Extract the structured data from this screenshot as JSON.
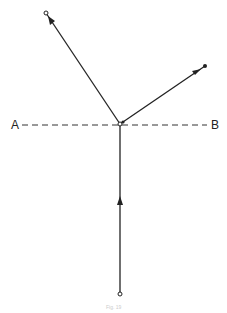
{
  "diagram": {
    "labels": {
      "left": "A",
      "right": "B"
    },
    "caption": "Fig. 19",
    "colors": {
      "line": "#222222",
      "background": "#ffffff"
    },
    "points": {
      "center": [
        120,
        124
      ],
      "top_left_end": [
        46,
        13
      ],
      "top_right_end": [
        205,
        66
      ],
      "bottom_end": [
        120,
        294
      ]
    },
    "dashed_line": {
      "y": 125,
      "x_start": 22,
      "x_end": 207
    }
  }
}
